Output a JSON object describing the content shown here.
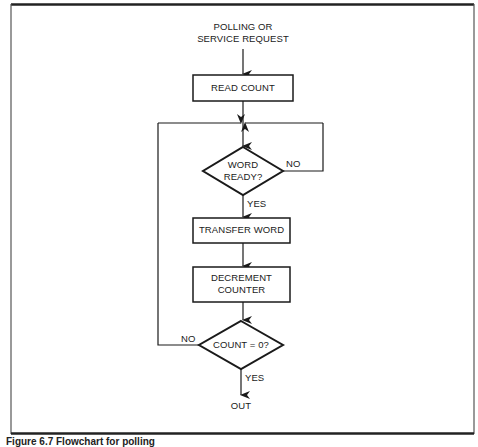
{
  "figure": {
    "caption": "Figure 6.7  Flowchart for polling"
  },
  "flowchart": {
    "start_label_line1": "POLLING OR",
    "start_label_line2": "SERVICE REQUEST",
    "steps": {
      "read_count": "READ COUNT",
      "word_ready_line1": "WORD",
      "word_ready_line2": "READY?",
      "transfer_word": "TRANSFER WORD",
      "decrement_line1": "DECREMENT",
      "decrement_line2": "COUNTER",
      "count_zero": "COUNT = 0?"
    },
    "branches": {
      "word_ready_no": "NO",
      "word_ready_yes": "YES",
      "count_zero_no": "NO",
      "count_zero_yes": "YES"
    },
    "end_label": "OUT"
  }
}
